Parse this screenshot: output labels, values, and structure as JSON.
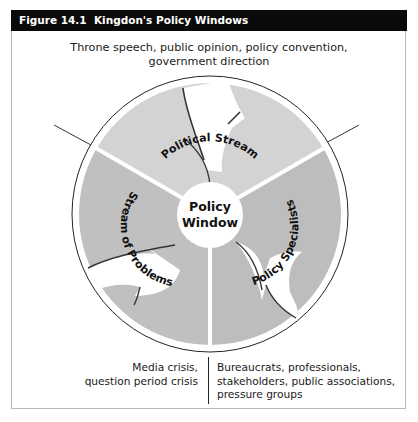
{
  "figure": {
    "header": "Figure 14.1  Kingdon's Policy Windows",
    "top_caption": {
      "line1": "Throne speech, public opinion, policy convention,",
      "line2": "government direction"
    },
    "center_label": {
      "line1": "Policy",
      "line2": "Window"
    },
    "sectors": [
      {
        "label": "Political Stream"
      },
      {
        "label": "Stream of Problems"
      },
      {
        "label": "Policy Specialists"
      }
    ],
    "bottom_left_caption": {
      "line1": "Media crisis,",
      "line2": "question period crisis"
    },
    "bottom_right_caption": {
      "line1": "Bureaucrats, professionals,",
      "line2": "stakeholders, public associations,",
      "line3": "pressure groups"
    },
    "colors": {
      "header_bg": "#0a0a0a",
      "sector_top": "#d3d3d3",
      "sector_sides": "#bfbfbf",
      "arrow": "#ffffff",
      "outline": "#222222"
    }
  }
}
